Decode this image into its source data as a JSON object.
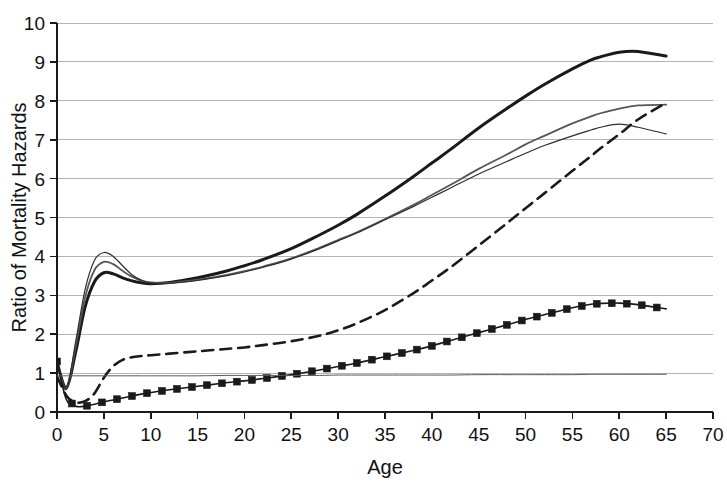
{
  "chart_data": {
    "type": "line",
    "title": "",
    "xlabel": "Age",
    "ylabel": "Ratio of Mortality Hazards",
    "xlim": [
      0,
      70
    ],
    "ylim": [
      0,
      10
    ],
    "xticks": [
      0,
      5,
      10,
      15,
      20,
      25,
      30,
      35,
      40,
      45,
      50,
      55,
      60,
      65,
      70
    ],
    "yticks": [
      0,
      1,
      2,
      3,
      4,
      5,
      6,
      7,
      8,
      9,
      10
    ],
    "xtick_labels": [
      "0",
      "5",
      "10",
      "15",
      "20",
      "25",
      "30",
      "35",
      "40",
      "45",
      "50",
      "55",
      "60",
      "65",
      "70"
    ],
    "ytick_labels": [
      "0",
      "1",
      "2",
      "3",
      "4",
      "5",
      "6",
      "7",
      "8",
      "9",
      "10"
    ],
    "grid": true,
    "grid_axis": "y",
    "grid_color": "#b4b4b4",
    "legend": "none",
    "background": "#ffffff",
    "axis_color": "#1a1a1a",
    "x": [
      0,
      1,
      2,
      3,
      4,
      5,
      6,
      7,
      8,
      9,
      10,
      12,
      15,
      18,
      20,
      22,
      25,
      28,
      30,
      32,
      35,
      38,
      40,
      42,
      45,
      48,
      50,
      52,
      55,
      57,
      58,
      60,
      62,
      65
    ],
    "series": [
      {
        "name": "curve-thick-black",
        "color": "#1a1a1a",
        "width": 3.0,
        "style": "solid",
        "marker": "none",
        "values": [
          1.3,
          0.62,
          1.55,
          2.7,
          3.35,
          3.58,
          3.55,
          3.45,
          3.37,
          3.32,
          3.3,
          3.33,
          3.45,
          3.62,
          3.76,
          3.92,
          4.2,
          4.55,
          4.8,
          5.08,
          5.55,
          6.05,
          6.4,
          6.75,
          7.3,
          7.8,
          8.12,
          8.42,
          8.82,
          9.05,
          9.13,
          9.25,
          9.27,
          9.15
        ]
      },
      {
        "name": "curve-medium-gray",
        "color": "#565656",
        "width": 1.8,
        "style": "solid",
        "marker": "none",
        "values": [
          1.32,
          0.6,
          1.7,
          2.95,
          3.65,
          3.86,
          3.8,
          3.63,
          3.48,
          3.38,
          3.33,
          3.32,
          3.4,
          3.52,
          3.62,
          3.74,
          3.95,
          4.22,
          4.42,
          4.62,
          4.96,
          5.32,
          5.58,
          5.84,
          6.25,
          6.62,
          6.88,
          7.1,
          7.42,
          7.6,
          7.68,
          7.8,
          7.88,
          7.9
        ]
      },
      {
        "name": "curve-thin-dark",
        "color": "#2d2d2d",
        "width": 1.2,
        "style": "solid",
        "marker": "none",
        "values": [
          1.34,
          0.58,
          1.82,
          3.15,
          3.9,
          4.1,
          4.0,
          3.76,
          3.53,
          3.39,
          3.32,
          3.31,
          3.38,
          3.5,
          3.6,
          3.72,
          3.93,
          4.2,
          4.4,
          4.6,
          4.94,
          5.28,
          5.52,
          5.76,
          6.12,
          6.44,
          6.65,
          6.85,
          7.1,
          7.25,
          7.32,
          7.4,
          7.32,
          7.15
        ]
      },
      {
        "name": "curve-dashed",
        "color": "#1a1a1a",
        "width": 2.6,
        "style": "dashed",
        "marker": "none",
        "values": [
          0.92,
          0.42,
          0.25,
          0.28,
          0.48,
          0.88,
          1.18,
          1.34,
          1.41,
          1.44,
          1.46,
          1.5,
          1.56,
          1.62,
          1.66,
          1.72,
          1.82,
          1.96,
          2.1,
          2.28,
          2.62,
          3.05,
          3.38,
          3.72,
          4.28,
          4.85,
          5.24,
          5.62,
          6.2,
          6.58,
          6.78,
          7.14,
          7.52,
          7.95
        ]
      },
      {
        "name": "curve-squares",
        "color": "#1a1a1a",
        "width": 1.6,
        "style": "solid",
        "marker": "square",
        "values": [
          1.3,
          0.32,
          0.15,
          0.15,
          0.2,
          0.26,
          0.31,
          0.36,
          0.41,
          0.46,
          0.5,
          0.57,
          0.66,
          0.75,
          0.8,
          0.86,
          0.96,
          1.08,
          1.17,
          1.26,
          1.42,
          1.58,
          1.7,
          1.84,
          2.04,
          2.24,
          2.38,
          2.5,
          2.68,
          2.77,
          2.79,
          2.8,
          2.76,
          2.65
        ]
      },
      {
        "name": "reference-line",
        "color": "#5a5a5a",
        "width": 1.0,
        "style": "solid",
        "marker": "none",
        "values": [
          0.93,
          0.93,
          0.93,
          0.93,
          0.93,
          0.93,
          0.93,
          0.93,
          0.93,
          0.93,
          0.93,
          0.93,
          0.93,
          0.94,
          0.94,
          0.94,
          0.94,
          0.94,
          0.95,
          0.95,
          0.95,
          0.95,
          0.95,
          0.95,
          0.96,
          0.96,
          0.96,
          0.96,
          0.96,
          0.97,
          0.97,
          0.97,
          0.97,
          0.97
        ]
      }
    ]
  }
}
